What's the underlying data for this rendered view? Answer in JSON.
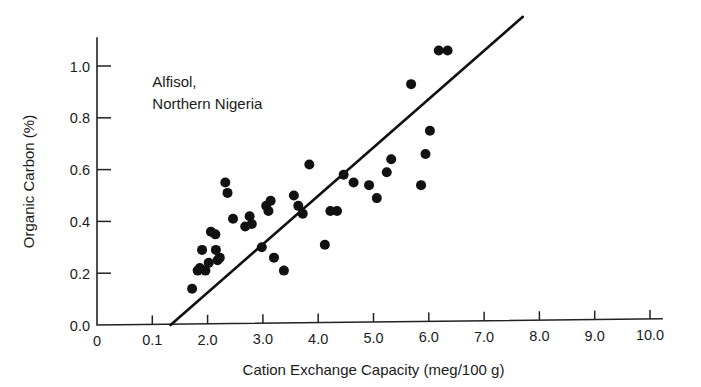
{
  "chart_data": {
    "type": "scatter",
    "title": "",
    "xlabel": "Cation Exchange Capacity (meg/100 g)",
    "ylabel": "Organic Carbon (%)",
    "xlim": [
      0,
      10.0
    ],
    "ylim": [
      0.0,
      1.06
    ],
    "grid": false,
    "legend_position": "none",
    "annotations": [
      {
        "text_line_1": "Alfisol,",
        "text_line_2": "Northern Nigeria",
        "x": 1.0,
        "y": 0.92
      }
    ],
    "xticks": [
      {
        "value": 0.0,
        "label": "0"
      },
      {
        "value": 1.0,
        "label": "0.1"
      },
      {
        "value": 2.0,
        "label": "2.0"
      },
      {
        "value": 3.0,
        "label": "3.0"
      },
      {
        "value": 4.0,
        "label": "4.0"
      },
      {
        "value": 5.0,
        "label": "5.0"
      },
      {
        "value": 6.0,
        "label": "6.0"
      },
      {
        "value": 7.0,
        "label": "7.0"
      },
      {
        "value": 8.0,
        "label": "8.0"
      },
      {
        "value": 9.0,
        "label": "9.0"
      },
      {
        "value": 10.0,
        "label": "10.0"
      }
    ],
    "yticks": [
      {
        "value": 0.0,
        "label": "0.0"
      },
      {
        "value": 0.2,
        "label": "0.2"
      },
      {
        "value": 0.4,
        "label": "0.4"
      },
      {
        "value": 0.6,
        "label": "0.6"
      },
      {
        "value": 0.8,
        "label": "0.8"
      },
      {
        "value": 1.0,
        "label": "1.0"
      }
    ],
    "series": [
      {
        "name": "Alfisol samples, Northern Nigeria",
        "marker": "filled-circle",
        "color": "#111111",
        "points": [
          {
            "x": 1.72,
            "y": 0.14
          },
          {
            "x": 1.82,
            "y": 0.21
          },
          {
            "x": 1.86,
            "y": 0.22
          },
          {
            "x": 1.9,
            "y": 0.29
          },
          {
            "x": 1.96,
            "y": 0.21
          },
          {
            "x": 2.02,
            "y": 0.24
          },
          {
            "x": 2.06,
            "y": 0.36
          },
          {
            "x": 2.14,
            "y": 0.35
          },
          {
            "x": 2.15,
            "y": 0.29
          },
          {
            "x": 2.18,
            "y": 0.25
          },
          {
            "x": 2.22,
            "y": 0.26
          },
          {
            "x": 2.32,
            "y": 0.55
          },
          {
            "x": 2.36,
            "y": 0.51
          },
          {
            "x": 2.46,
            "y": 0.41
          },
          {
            "x": 2.68,
            "y": 0.38
          },
          {
            "x": 2.76,
            "y": 0.42
          },
          {
            "x": 2.8,
            "y": 0.39
          },
          {
            "x": 2.98,
            "y": 0.3
          },
          {
            "x": 3.06,
            "y": 0.46
          },
          {
            "x": 3.1,
            "y": 0.44
          },
          {
            "x": 3.14,
            "y": 0.48
          },
          {
            "x": 3.2,
            "y": 0.26
          },
          {
            "x": 3.38,
            "y": 0.21
          },
          {
            "x": 3.56,
            "y": 0.5
          },
          {
            "x": 3.64,
            "y": 0.46
          },
          {
            "x": 3.72,
            "y": 0.43
          },
          {
            "x": 3.84,
            "y": 0.62
          },
          {
            "x": 4.12,
            "y": 0.31
          },
          {
            "x": 4.22,
            "y": 0.44
          },
          {
            "x": 4.34,
            "y": 0.44
          },
          {
            "x": 4.46,
            "y": 0.58
          },
          {
            "x": 4.64,
            "y": 0.55
          },
          {
            "x": 4.92,
            "y": 0.54
          },
          {
            "x": 5.06,
            "y": 0.49
          },
          {
            "x": 5.24,
            "y": 0.59
          },
          {
            "x": 5.32,
            "y": 0.64
          },
          {
            "x": 5.68,
            "y": 0.93
          },
          {
            "x": 5.86,
            "y": 0.54
          },
          {
            "x": 5.94,
            "y": 0.66
          },
          {
            "x": 6.02,
            "y": 0.75
          },
          {
            "x": 6.18,
            "y": 1.06
          },
          {
            "x": 6.34,
            "y": 1.06
          }
        ]
      }
    ],
    "fit_line": {
      "name": "regression-line",
      "x_start": 1.33,
      "y_start": 0.0,
      "x_end": 7.7,
      "y_end": 1.19
    }
  }
}
